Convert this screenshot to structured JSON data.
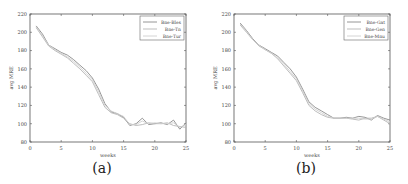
{
  "chart_data": [
    {
      "type": "line",
      "caption": "(a)",
      "title": "",
      "xlabel": "weeks",
      "ylabel": "avg MRE",
      "xlim": [
        0,
        25
      ],
      "ylim": [
        80,
        220
      ],
      "xticks": [
        0,
        5,
        10,
        15,
        20,
        25
      ],
      "yticks": [
        80,
        100,
        120,
        140,
        160,
        180,
        200,
        220
      ],
      "grid": false,
      "legend_position": "upper right",
      "x": [
        1,
        2,
        3,
        4,
        5,
        6,
        7,
        8,
        9,
        10,
        11,
        12,
        13,
        14,
        15,
        16,
        17,
        18,
        19,
        20,
        21,
        22,
        23,
        24,
        25
      ],
      "series": [
        {
          "name": "Bne-Bles",
          "color": "#8a8a8a",
          "values": [
            207,
            198,
            186,
            182,
            178,
            175,
            170,
            164,
            158,
            150,
            138,
            122,
            113,
            111,
            107,
            98,
            100,
            106,
            99,
            100,
            101,
            99,
            104,
            94,
            101
          ]
        },
        {
          "name": "Bne-Tn",
          "color": "#b5b5b5",
          "values": [
            205,
            195,
            185,
            180,
            176,
            172,
            166,
            160,
            153,
            146,
            132,
            118,
            112,
            110,
            106,
            100,
            98,
            99,
            101,
            100,
            100,
            101,
            98,
            97,
            96
          ]
        },
        {
          "name": "Bne-Tur",
          "color": "#cfcfcf",
          "values": [
            206,
            196,
            186,
            181,
            177,
            173,
            168,
            162,
            155,
            148,
            135,
            120,
            114,
            111,
            108,
            99,
            99,
            103,
            100,
            101,
            100,
            100,
            101,
            96,
            99
          ]
        }
      ]
    },
    {
      "type": "line",
      "caption": "(b)",
      "title": "",
      "xlabel": "weeks",
      "ylabel": "avg MRE",
      "xlim": [
        0,
        25
      ],
      "ylim": [
        80,
        220
      ],
      "xticks": [
        0,
        5,
        10,
        15,
        20,
        25
      ],
      "yticks": [
        80,
        100,
        120,
        140,
        160,
        180,
        200,
        220
      ],
      "grid": false,
      "legend_position": "upper right",
      "x": [
        1,
        2,
        3,
        4,
        5,
        6,
        7,
        8,
        9,
        10,
        11,
        12,
        13,
        14,
        15,
        16,
        17,
        18,
        19,
        20,
        21,
        22,
        23,
        24,
        25
      ],
      "series": [
        {
          "name": "Bne-Gat",
          "color": "#8a8a8a",
          "values": [
            210,
            202,
            193,
            186,
            182,
            178,
            174,
            167,
            160,
            151,
            138,
            124,
            118,
            114,
            110,
            106,
            106,
            107,
            106,
            108,
            107,
            104,
            109,
            106,
            104
          ]
        },
        {
          "name": "Bne-Gen",
          "color": "#b5b5b5",
          "values": [
            208,
            200,
            192,
            185,
            181,
            177,
            171,
            163,
            155,
            147,
            134,
            120,
            114,
            110,
            107,
            106,
            106,
            106,
            105,
            104,
            106,
            106,
            108,
            104,
            100
          ]
        },
        {
          "name": "Bne-Mnu",
          "color": "#cfcfcf",
          "values": [
            209,
            201,
            192,
            186,
            181,
            177,
            172,
            165,
            157,
            149,
            136,
            122,
            116,
            112,
            108,
            106,
            106,
            106,
            106,
            106,
            105,
            105,
            108,
            105,
            102
          ]
        }
      ]
    }
  ]
}
